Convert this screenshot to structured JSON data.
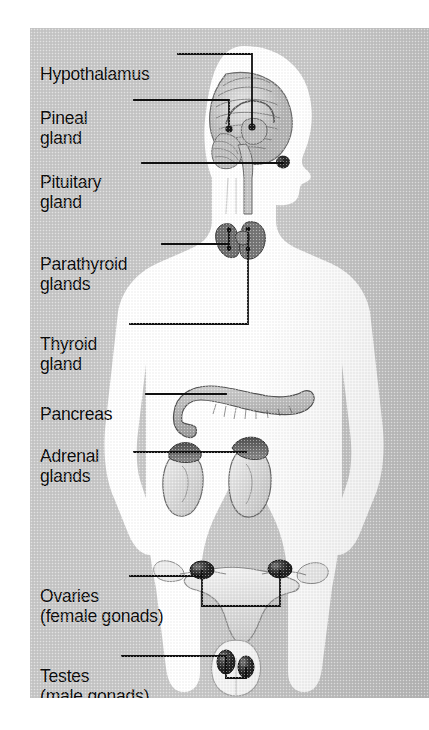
{
  "figure": {
    "frame": {
      "x": 30,
      "y": 28,
      "width": 399,
      "height": 670,
      "background_color": "#c9c9c9",
      "body_color": "#ffffff"
    }
  },
  "palette": {
    "plate_gray": "#c9c9c9",
    "body_white": "#ffffff",
    "line_black": "#111111",
    "organ_mid_gray": "#a8a8a8",
    "organ_dark_gray": "#4a4a4a",
    "organ_light_gray": "#e2e2e2",
    "gonad_dark": "#2e2e2e"
  },
  "labels": [
    {
      "id": "hypothalamus",
      "text": "Hypothalamus",
      "x": 10,
      "y": 18,
      "lines": 1,
      "target": "hypothalamus-dot"
    },
    {
      "id": "pineal",
      "text": "Pineal",
      "sub": "gland",
      "x": 10,
      "y": 62,
      "lines": 2,
      "target": "pineal-dot"
    },
    {
      "id": "pituitary",
      "text": "Pituitary",
      "sub": "gland",
      "x": 10,
      "y": 126,
      "lines": 2,
      "target": "pituitary-dot"
    },
    {
      "id": "parathyroid",
      "text": "Parathyroid",
      "sub": "glands",
      "x": 10,
      "y": 208,
      "lines": 2,
      "target": "parathyroid-dots"
    },
    {
      "id": "thyroid",
      "text": "Thyroid",
      "sub": "gland",
      "x": 10,
      "y": 288,
      "lines": 2,
      "target": "thyroid-dot"
    },
    {
      "id": "pancreas",
      "text": "Pancreas",
      "x": 10,
      "y": 358,
      "lines": 1,
      "target": "pancreas-dot"
    },
    {
      "id": "adrenal",
      "text": "Adrenal",
      "sub": "glands",
      "x": 10,
      "y": 400,
      "lines": 2,
      "target": "adrenal-dots"
    },
    {
      "id": "ovaries",
      "text": "Ovaries",
      "sub": "(female gonads)",
      "x": 10,
      "y": 540,
      "lines": 2,
      "target": "ovary-dots"
    },
    {
      "id": "testes",
      "text": "Testes",
      "sub": "(male gonads)",
      "x": 10,
      "y": 620,
      "lines": 2,
      "target": "testis-dots"
    }
  ],
  "organs": [
    {
      "id": "brain",
      "name": "brain-sagittal-section",
      "region": "head"
    },
    {
      "id": "hypothalamus",
      "name": "hypothalamus",
      "region": "brain"
    },
    {
      "id": "pineal",
      "name": "pineal-gland",
      "region": "brain"
    },
    {
      "id": "pituitary",
      "name": "pituitary-gland",
      "region": "brain"
    },
    {
      "id": "thyroid",
      "name": "thyroid-gland",
      "region": "neck"
    },
    {
      "id": "parathyroid",
      "name": "parathyroid-glands",
      "region": "neck",
      "count": 4
    },
    {
      "id": "pancreas",
      "name": "pancreas",
      "region": "abdomen"
    },
    {
      "id": "adrenals",
      "name": "adrenal-glands",
      "region": "abdomen",
      "count": 2
    },
    {
      "id": "kidneys",
      "name": "kidneys",
      "region": "abdomen",
      "count": 2
    },
    {
      "id": "uterus",
      "name": "uterus-and-fallopian-tubes",
      "region": "pelvis"
    },
    {
      "id": "ovaries",
      "name": "ovaries",
      "region": "pelvis",
      "count": 2
    },
    {
      "id": "testes",
      "name": "testes",
      "region": "pelvis",
      "count": 2
    },
    {
      "id": "scrotum",
      "name": "scrotum-outline",
      "region": "pelvis"
    }
  ]
}
